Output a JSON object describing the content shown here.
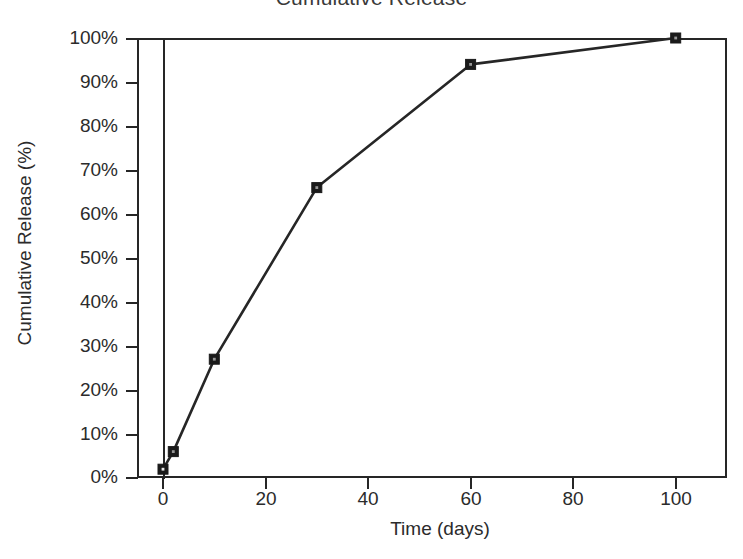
{
  "chart_data": {
    "type": "line",
    "title": "Cumulative Release",
    "xlabel": "Time (days)",
    "ylabel": "Cumulative Release (%)",
    "xlim": [
      0,
      110
    ],
    "ylim": [
      0,
      100
    ],
    "grid": false,
    "legend": "none",
    "marker": "square",
    "x_tick_labels": [
      "0",
      "20",
      "40",
      "60",
      "80",
      "100"
    ],
    "x_tick_values": [
      0,
      20,
      40,
      60,
      80,
      100
    ],
    "y_tick_labels": [
      "0%",
      "10%",
      "20%",
      "30%",
      "40%",
      "50%",
      "60%",
      "70%",
      "80%",
      "90%",
      "100%"
    ],
    "y_tick_values": [
      0,
      10,
      20,
      30,
      40,
      50,
      60,
      70,
      80,
      90,
      100
    ],
    "series": [
      {
        "name": "Cumulative Release",
        "x": [
          0,
          2,
          10,
          30,
          60,
          100
        ],
        "values": [
          2,
          6,
          27,
          66,
          94,
          100
        ]
      }
    ],
    "colors": {
      "line": "#262626",
      "marker": "#1a1a1a",
      "axis": "#262626",
      "text": "#2b2b2b",
      "background": "#ffffff"
    }
  }
}
